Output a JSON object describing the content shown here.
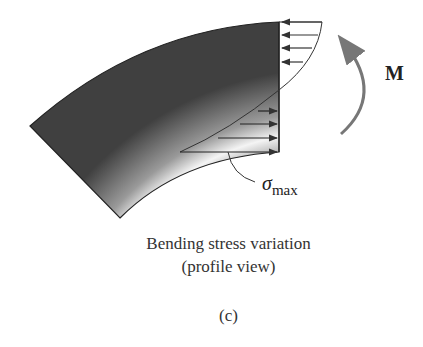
{
  "figure": {
    "moment_label": "M",
    "sigma_symbol": "σ",
    "sigma_subscript": "max",
    "caption_line1": "Bending stress variation",
    "caption_line2": "(profile view)",
    "panel_label": "(c)"
  },
  "colors": {
    "beam_dark": "#3a3a3a",
    "beam_light": "#f2f2f2",
    "arrow": "#444444",
    "moment_arrow": "#777777",
    "text": "#222222"
  }
}
